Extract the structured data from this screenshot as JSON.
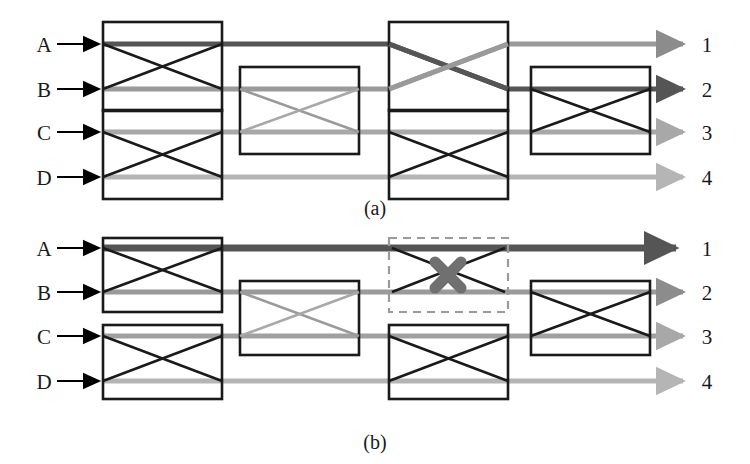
{
  "figure": {
    "width": 750,
    "height": 464,
    "background": "#ffffff",
    "panels": [
      {
        "id": "panel-a",
        "caption": "(a)",
        "caption_x": 375,
        "caption_y": 213,
        "offset_y": 0,
        "input_labels": [
          "A",
          "B",
          "C",
          "D"
        ],
        "output_labels": [
          "1",
          "2",
          "3",
          "4"
        ],
        "rows_y": [
          44,
          89,
          132,
          177
        ],
        "label_x": 44,
        "output_label_x": 705,
        "arrow_in_x1": 57,
        "arrow_in_x2": 103,
        "arrow_out_x1": 585,
        "arrow_out_x2": 688,
        "switches": [
          {
            "name": "switch-a-c1-top",
            "x": 103,
            "y": 22,
            "w": 119,
            "h": 89,
            "rows": [
              0,
              1
            ],
            "crossed": true,
            "dashed": false,
            "disabled": false
          },
          {
            "name": "switch-a-c1-bottom",
            "x": 103,
            "y": 110,
            "w": 119,
            "h": 89,
            "rows": [
              2,
              3
            ],
            "crossed": true,
            "dashed": false,
            "disabled": false
          },
          {
            "name": "switch-a-c2-mid",
            "x": 240,
            "y": 67,
            "w": 119,
            "h": 87,
            "rows": [
              1,
              2
            ],
            "crossed": true,
            "dashed": false,
            "disabled": false
          },
          {
            "name": "switch-a-c3-top",
            "x": 389,
            "y": 22,
            "w": 119,
            "h": 89,
            "rows": [
              0,
              1
            ],
            "crossed": true,
            "dashed": false,
            "disabled": false
          },
          {
            "name": "switch-a-c3-bottom",
            "x": 389,
            "y": 110,
            "w": 119,
            "h": 89,
            "rows": [
              2,
              3
            ],
            "crossed": true,
            "dashed": false,
            "disabled": false
          },
          {
            "name": "switch-a-c4-mid",
            "x": 531,
            "y": 67,
            "w": 119,
            "h": 87,
            "rows": [
              1,
              2
            ],
            "crossed": true,
            "dashed": false,
            "disabled": false
          }
        ],
        "signals": [
          {
            "name": "signal-a-dark",
            "color": "#555555",
            "width": 5,
            "arrow": "mid",
            "points": "103,44 389,44 508,89 650,89 688,89"
          },
          {
            "name": "signal-a-midgray",
            "color": "#8c8c8c",
            "width": 5,
            "arrow": "light",
            "points": "103,89 389,89 508,44 688,44"
          },
          {
            "name": "signal-a-lightgray",
            "color": "#a8a8a8",
            "width": 5,
            "arrow": "light",
            "points": "103,132 688,132"
          },
          {
            "name": "signal-a-palegray",
            "color": "#b5b5b5",
            "width": 5,
            "arrow": "light",
            "points": "103,177 688,177"
          }
        ]
      },
      {
        "id": "panel-b",
        "caption": "(b)",
        "caption_x": 375,
        "caption_y": 447,
        "offset_y": 232,
        "input_labels": [
          "A",
          "B",
          "C",
          "D"
        ],
        "output_labels": [
          "1",
          "2",
          "3",
          "4"
        ],
        "rows_y": [
          248,
          292,
          336,
          381
        ],
        "label_x": 44,
        "output_label_x": 705,
        "arrow_in_x1": 57,
        "arrow_in_x2": 103,
        "arrow_out_x1": 585,
        "arrow_out_x2": 688,
        "switches": [
          {
            "name": "switch-b-c1-top",
            "x": 103,
            "y": 238,
            "w": 119,
            "h": 74,
            "rows": [
              0,
              1
            ],
            "crossed": true,
            "dashed": false,
            "disabled": false
          },
          {
            "name": "switch-b-c1-bottom",
            "x": 103,
            "y": 325,
            "w": 119,
            "h": 74,
            "rows": [
              2,
              3
            ],
            "crossed": true,
            "dashed": false,
            "disabled": false
          },
          {
            "name": "switch-b-c2-mid",
            "x": 240,
            "y": 281,
            "w": 119,
            "h": 74,
            "rows": [
              1,
              2
            ],
            "crossed": true,
            "dashed": false,
            "disabled": false
          },
          {
            "name": "switch-b-c3-top-disabled",
            "x": 389,
            "y": 238,
            "w": 119,
            "h": 74,
            "rows": [
              0,
              1
            ],
            "crossed": true,
            "dashed": true,
            "disabled": true
          },
          {
            "name": "switch-b-c3-bottom",
            "x": 389,
            "y": 325,
            "w": 119,
            "h": 74,
            "rows": [
              2,
              3
            ],
            "crossed": true,
            "dashed": false,
            "disabled": false
          },
          {
            "name": "switch-b-c4-mid",
            "x": 531,
            "y": 281,
            "w": 119,
            "h": 74,
            "rows": [
              1,
              2
            ],
            "crossed": true,
            "dashed": false,
            "disabled": false
          }
        ],
        "signals": [
          {
            "name": "signal-b-dark",
            "color": "#555555",
            "width": 7,
            "arrow": "dark-thick",
            "points": "103,248 688,248"
          },
          {
            "name": "signal-b-midgray",
            "color": "#8c8c8c",
            "width": 5,
            "arrow": "light",
            "points": "103,292 688,292"
          },
          {
            "name": "signal-b-lightgray",
            "color": "#a0a0a0",
            "width": 5,
            "arrow": "light",
            "points": "103,336 688,336"
          },
          {
            "name": "signal-b-palegray",
            "color": "#b5b5b5",
            "width": 5,
            "arrow": "light",
            "points": "103,381 688,381"
          }
        ],
        "fault_marker": {
          "name": "fault-x-marker",
          "cx": 448,
          "cy": 275,
          "size": 17,
          "color": "#707070",
          "stroke_width": 11
        }
      }
    ],
    "colors": {
      "box_stroke": "#1a1a1a",
      "dashed_stroke": "#9a9a9a",
      "input_arrow": "#000000",
      "text": "#1a1a1a",
      "signal_dark": "#555555",
      "signal_mid": "#8c8c8c",
      "signal_light": "#a8a8a8",
      "fault": "#707070"
    }
  }
}
